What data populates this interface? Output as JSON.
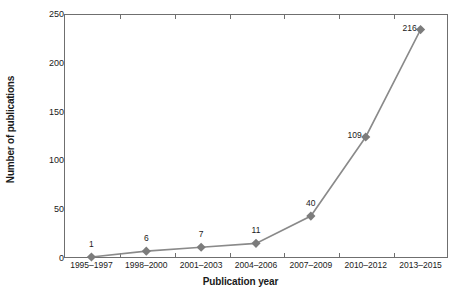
{
  "chart_data": {
    "type": "line",
    "title": "",
    "xlabel": "Publication year",
    "ylabel": "Number of publications",
    "categories": [
      "1995–1997",
      "1998–2000",
      "2001–2003",
      "2004–2006",
      "2007–2009",
      "2010–2012",
      "2013–2015"
    ],
    "values": [
      1,
      6,
      7,
      11,
      40,
      109,
      216
    ],
    "point_labels": [
      "1",
      "6",
      "7",
      "11",
      "40",
      "109",
      "216"
    ],
    "plotted_values": [
      1,
      7,
      11,
      15,
      43,
      124,
      234
    ],
    "ylim": [
      0,
      250
    ],
    "yticks": [
      0,
      50,
      100,
      150,
      200,
      250
    ],
    "ytick_labels": [
      "0",
      "50",
      "100",
      "150",
      "200",
      "250"
    ],
    "grid": false,
    "legend": null,
    "series": [
      {
        "name": "Number of publications",
        "values": [
          1,
          6,
          7,
          11,
          40,
          109,
          216
        ],
        "marker": "diamond",
        "color": "#7c7c7c",
        "line_color": "#8a8a8a"
      }
    ],
    "colors": {
      "marker": "#7c7c7c",
      "line": "#8a8a8a",
      "axis": "#6f6f6f",
      "text": "#1a1a1a",
      "background": "#ffffff"
    }
  }
}
